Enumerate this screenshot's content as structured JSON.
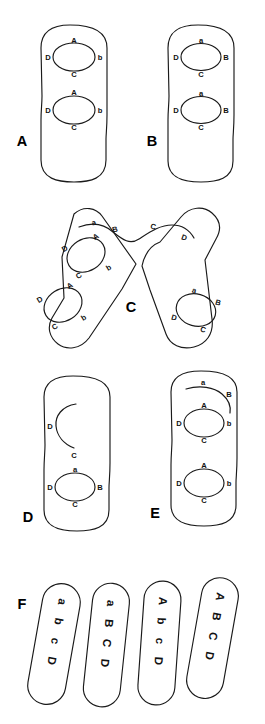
{
  "figure": {
    "background_color": "#ffffff",
    "line_color": "#1a1a1a"
  },
  "panels": [
    {
      "id": "A",
      "label": "A",
      "shape": "rounded-rectangle",
      "loops": [
        {
          "top": "A",
          "left": "D",
          "right": "b",
          "bottom": "C"
        },
        {
          "top": "A",
          "left": "D",
          "right": "b",
          "bottom": "C"
        }
      ]
    },
    {
      "id": "B",
      "label": "B",
      "shape": "rounded-rectangle",
      "loops": [
        {
          "top": "a",
          "left": "D",
          "right": "B",
          "bottom": "C"
        },
        {
          "top": "a",
          "left": "D",
          "right": "B",
          "bottom": "C"
        }
      ]
    },
    {
      "id": "C",
      "label": "C",
      "shape": "two-tilted-arms",
      "top_strand": [
        "a",
        "B",
        "C",
        "D"
      ],
      "left_arm_loops": [
        {
          "top": "A",
          "left": "D",
          "right": "b",
          "bottom": "C"
        },
        {
          "top": "A",
          "left": "D",
          "right": "b",
          "bottom": "C"
        }
      ],
      "right_arm_loops": [
        {
          "top": "a",
          "left": "D",
          "right": "B",
          "bottom": "C"
        }
      ]
    },
    {
      "id": "D",
      "label": "D",
      "shape": "rounded-rectangle",
      "open_arc": {
        "left": "D",
        "bottom": "C"
      },
      "loops": [
        {
          "top": "a",
          "left": "D",
          "right": "B",
          "bottom": "C"
        }
      ]
    },
    {
      "id": "E",
      "label": "E",
      "shape": "rounded-rectangle",
      "open_arc": {
        "left": "a",
        "right": "B"
      },
      "loops": [
        {
          "top": "A",
          "left": "D",
          "right": "b",
          "bottom": "C"
        },
        {
          "top": "A",
          "left": "D",
          "right": "b",
          "bottom": "C"
        }
      ]
    },
    {
      "id": "F",
      "label": "F",
      "shape": "four-tilted-strips",
      "strips": [
        {
          "letters": [
            "a",
            "b",
            "c",
            "D"
          ]
        },
        {
          "letters": [
            "a",
            "B",
            "C",
            "D"
          ]
        },
        {
          "letters": [
            "A",
            "b",
            "c",
            "D"
          ]
        },
        {
          "letters": [
            "A",
            "B",
            "C",
            "D"
          ]
        }
      ]
    }
  ]
}
